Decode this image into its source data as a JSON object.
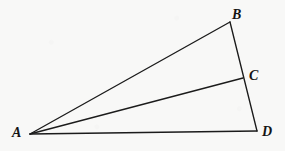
{
  "figure": {
    "kind": "geometry-diagram",
    "background_color": "#f8f8f7",
    "stroke_color": "#1b1b1b",
    "label_color": "#141414",
    "width": 285,
    "height": 151,
    "points": {
      "A": {
        "label": "A",
        "x": 30,
        "y": 134
      },
      "B": {
        "label": "B",
        "x": 230,
        "y": 22
      },
      "C": {
        "label": "C",
        "x": 243,
        "y": 78
      },
      "D": {
        "label": "D",
        "x": 257,
        "y": 131
      }
    },
    "segments": [
      {
        "name": "AB",
        "from": "A",
        "to": "B"
      },
      {
        "name": "BD",
        "from": "B",
        "to": "D"
      },
      {
        "name": "AD",
        "from": "A",
        "to": "D"
      },
      {
        "name": "AC",
        "from": "A",
        "to": "C"
      }
    ]
  }
}
